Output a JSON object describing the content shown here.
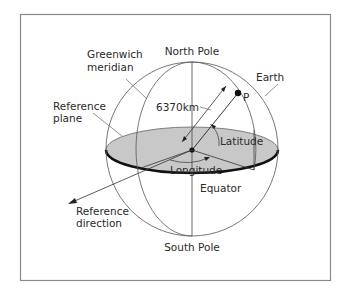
{
  "diagram": {
    "labels": {
      "north_pole": "North Pole",
      "south_pole": "South Pole",
      "greenwich_line1": "Greenwich",
      "greenwich_line2": "meridian",
      "earth": "Earth",
      "reference_plane_line1": "Reference",
      "reference_plane_line2": "plane",
      "radius": "6370km",
      "point": "P",
      "latitude": "Latitude",
      "longitude": "Longitude",
      "equator": "Equator",
      "reference_direction_line1": "Reference",
      "reference_direction_line2": "direction"
    },
    "colors": {
      "plane_fill": "#c8c8c8",
      "equator_stroke": "#111111",
      "line": "#555555",
      "frame": "#888888"
    }
  }
}
